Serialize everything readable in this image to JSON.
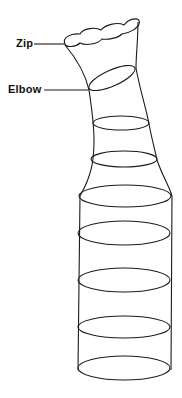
{
  "diagram": {
    "labels": {
      "zip": "Zip",
      "elbow": "Elbow"
    },
    "stroke_color": "#1a1a1a",
    "background": "#ffffff",
    "rings_count": 8
  }
}
